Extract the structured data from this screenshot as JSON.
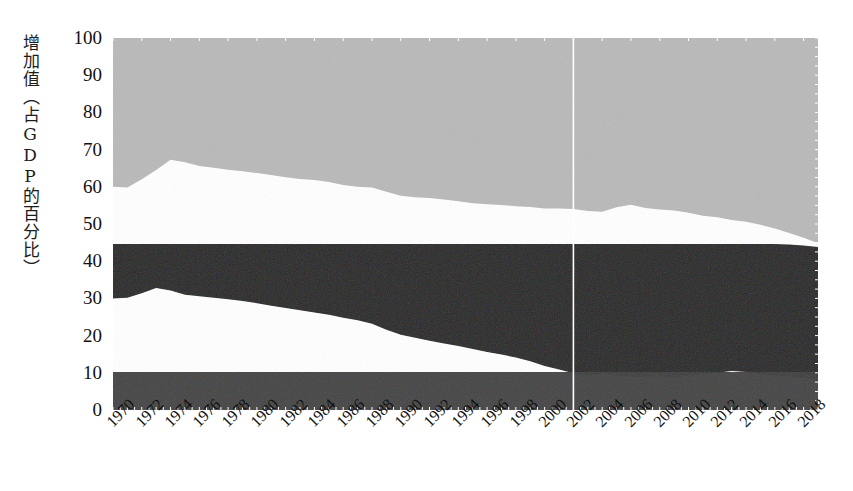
{
  "chart_data": {
    "type": "area",
    "title": "",
    "subtitle": "",
    "xlabel": "",
    "ylabel": "增加值（占GDP的百分比）",
    "ylim": [
      0,
      100
    ],
    "xlim": [
      1970,
      2019
    ],
    "ytick_labels": [
      "100",
      "90",
      "80",
      "70",
      "60",
      "50",
      "40",
      "30",
      "20",
      "10",
      "0"
    ],
    "ytick_values": [
      100,
      90,
      80,
      70,
      60,
      50,
      40,
      30,
      20,
      10,
      0
    ],
    "xtick_labels": [
      "1970",
      "1972",
      "1974",
      "1976",
      "1978",
      "1980",
      "1982",
      "1984",
      "1986",
      "1988",
      "1990",
      "1992",
      "1994",
      "1996",
      "1998",
      "2000",
      "2002",
      "2004",
      "2006",
      "2008",
      "2010",
      "2012",
      "2014",
      "2016",
      "2018"
    ],
    "xtick_values": [
      1970,
      1972,
      1974,
      1976,
      1978,
      1980,
      1982,
      1984,
      1986,
      1988,
      1990,
      1992,
      1994,
      1996,
      1998,
      2000,
      2002,
      2004,
      2006,
      2008,
      2010,
      2012,
      2014,
      2016,
      2018
    ],
    "grid": false,
    "legend_position": "none",
    "colors": {
      "services_band": "#b7b7b7",
      "industry_band": "#161616",
      "agriculture_band": "#3b3b3b",
      "background": "#ffffff",
      "axis_text": "#111111",
      "gridline": "#ffffff"
    },
    "vertical_marker_year": 2002,
    "x": [
      1970,
      1971,
      1972,
      1973,
      1974,
      1975,
      1976,
      1977,
      1978,
      1979,
      1980,
      1981,
      1982,
      1983,
      1984,
      1985,
      1986,
      1987,
      1988,
      1989,
      1990,
      1991,
      1992,
      1993,
      1994,
      1995,
      1996,
      1997,
      1998,
      1999,
      2000,
      2001,
      2002,
      2003,
      2004,
      2005,
      2006,
      2007,
      2008,
      2009,
      2010,
      2011,
      2012,
      2013,
      2014,
      2015,
      2016,
      2017,
      2018,
      2019
    ],
    "series": [
      {
        "name": "services_band_top",
        "values": [
          100,
          100,
          100,
          100,
          100,
          100,
          100,
          100,
          100,
          100,
          100,
          100,
          100,
          100,
          100,
          100,
          100,
          100,
          100,
          100,
          100,
          100,
          100,
          100,
          100,
          100,
          100,
          100,
          100,
          100,
          100,
          100,
          100,
          100,
          100,
          100,
          100,
          100,
          100,
          100,
          100,
          100,
          100,
          100,
          100,
          100,
          100,
          100,
          100,
          100
        ]
      },
      {
        "name": "services_band_bottom",
        "values": [
          60.0,
          59.8,
          62.0,
          64.5,
          67.3,
          66.6,
          65.6,
          65.1,
          64.6,
          64.2,
          63.7,
          63.2,
          62.6,
          62.1,
          61.8,
          61.3,
          60.5,
          60.0,
          59.8,
          58.7,
          57.6,
          57.2,
          57.0,
          56.6,
          56.1,
          55.6,
          55.3,
          55.1,
          54.8,
          54.6,
          54.2,
          54.2,
          54.0,
          53.5,
          53.3,
          54.5,
          55.2,
          54.3,
          53.9,
          53.6,
          53.0,
          52.2,
          51.8,
          51.1,
          50.6,
          49.8,
          48.8,
          47.6,
          46.3,
          44.8
        ]
      },
      {
        "name": "industry_band_top",
        "values": [
          44.6,
          44.6,
          44.6,
          44.6,
          44.6,
          44.6,
          44.6,
          44.6,
          44.6,
          44.6,
          44.6,
          44.6,
          44.6,
          44.6,
          44.6,
          44.6,
          44.6,
          44.6,
          44.6,
          44.6,
          44.6,
          44.6,
          44.6,
          44.6,
          44.6,
          44.6,
          44.6,
          44.6,
          44.6,
          44.6,
          44.6,
          44.6,
          44.6,
          44.6,
          44.6,
          44.6,
          44.6,
          44.6,
          44.6,
          44.6,
          44.6,
          44.6,
          44.6,
          44.6,
          44.6,
          44.6,
          44.6,
          44.5,
          44.2,
          43.8
        ]
      },
      {
        "name": "industry_band_bottom",
        "values": [
          30.0,
          30.2,
          31.4,
          32.8,
          32.1,
          31.0,
          30.6,
          30.2,
          29.8,
          29.3,
          28.7,
          28.0,
          27.4,
          26.8,
          26.2,
          25.6,
          24.8,
          24.1,
          23.2,
          21.6,
          20.2,
          19.4,
          18.6,
          17.9,
          17.2,
          16.4,
          15.6,
          14.9,
          14.1,
          13.1,
          11.8,
          10.9,
          9.9,
          9.4,
          9.6,
          9.2,
          9.0,
          8.9,
          9.1,
          8.7,
          9.2,
          9.6,
          10.0,
          10.5,
          10.2,
          9.6,
          9.3,
          9.0,
          8.6,
          8.2
        ]
      },
      {
        "name": "agriculture_band_top",
        "values": [
          10.2,
          10.2,
          10.2,
          10.2,
          10.2,
          10.2,
          10.2,
          10.2,
          10.2,
          10.2,
          10.2,
          10.2,
          10.2,
          10.2,
          10.2,
          10.2,
          10.2,
          10.2,
          10.2,
          10.2,
          10.2,
          10.2,
          10.2,
          10.2,
          10.2,
          10.2,
          10.2,
          10.2,
          10.2,
          10.2,
          10.2,
          10.2,
          10.2,
          10.2,
          10.2,
          10.2,
          10.2,
          10.2,
          10.2,
          10.2,
          10.2,
          10.2,
          10.2,
          10.2,
          10.2,
          10.2,
          10.2,
          10.2,
          10.2,
          10.2
        ]
      },
      {
        "name": "agriculture_band_bottom",
        "values": [
          0,
          0,
          0,
          0,
          0,
          0,
          0,
          0,
          0,
          0,
          0,
          0,
          0,
          0,
          0,
          0,
          0,
          0,
          0,
          0,
          0,
          0,
          0,
          0,
          0,
          0,
          0,
          0,
          0,
          0,
          0,
          0,
          0,
          0,
          0,
          0,
          0,
          0,
          0,
          0,
          0,
          0,
          0,
          0,
          0,
          0,
          0,
          0,
          0,
          0
        ]
      }
    ]
  }
}
